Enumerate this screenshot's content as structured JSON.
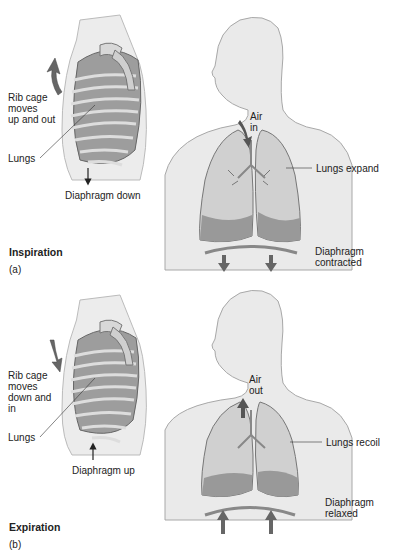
{
  "panels": [
    {
      "id": "a",
      "phase_title": "Inspiration",
      "panel_letter": "(a)",
      "ribcage_label": "Rib cage\nmoves\nup and out",
      "lungs_label": "Lungs",
      "diaphragm_arrow_label": "Diaphragm down",
      "air_label": "Air\nin",
      "lungs_state_label": "Lungs expand",
      "diaphragm_state_label": "Diaphragm\ncontracted"
    },
    {
      "id": "b",
      "phase_title": "Expiration",
      "panel_letter": "(b)",
      "ribcage_label": "Rib cage\nmoves\ndown and\nin",
      "lungs_label": "Lungs",
      "diaphragm_arrow_label": "Diaphragm up",
      "air_label": "Air\nout",
      "lungs_state_label": "Lungs recoil",
      "diaphragm_state_label": "Diaphragm\nrelaxed"
    }
  ],
  "colors": {
    "body_fill": "#e6e6e6",
    "body_outline": "#9a9a9a",
    "lung_fill": "#c8c8c8",
    "lung_dark": "#8c8c8c",
    "arrow": "#555555"
  }
}
